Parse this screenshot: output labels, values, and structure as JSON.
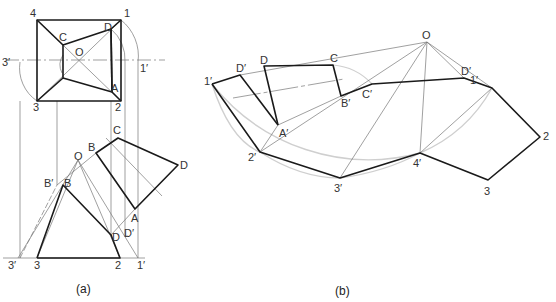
{
  "figure": {
    "type": "technical-drawing"
  },
  "panel_a": {
    "caption": "(a)",
    "top_view_labels": [
      {
        "id": "4",
        "text": "4",
        "x": 30,
        "y": 8
      },
      {
        "id": "1",
        "text": "1",
        "x": 124,
        "y": 8
      },
      {
        "id": "C",
        "text": "C",
        "x": 59,
        "y": 32
      },
      {
        "id": "D",
        "text": "D",
        "x": 104,
        "y": 22
      },
      {
        "id": "O",
        "text": "O",
        "x": 75,
        "y": 47
      },
      {
        "id": "3p",
        "text": "3′",
        "x": 2,
        "y": 57
      },
      {
        "id": "1p",
        "text": "1′",
        "x": 140,
        "y": 63
      },
      {
        "id": "A",
        "text": "A",
        "x": 111,
        "y": 83
      },
      {
        "id": "3",
        "text": "3",
        "x": 33,
        "y": 102
      },
      {
        "id": "2",
        "text": "2",
        "x": 115,
        "y": 102
      }
    ],
    "front_view_labels": [
      {
        "id": "O",
        "text": "O",
        "x": 74,
        "y": 131
      },
      {
        "id": "C",
        "text": "C",
        "x": 113,
        "y": 120
      },
      {
        "id": "B_upper",
        "text": "B",
        "x": 89,
        "y": 142
      },
      {
        "id": "D_right",
        "text": "D",
        "x": 178,
        "y": 160
      },
      {
        "id": "Bp",
        "text": "B′",
        "x": 44,
        "y": 178
      },
      {
        "id": "B",
        "text": "B",
        "x": 64,
        "y": 178
      },
      {
        "id": "A",
        "text": "A",
        "x": 130,
        "y": 214
      },
      {
        "id": "D",
        "text": "D",
        "x": 111,
        "y": 230
      },
      {
        "id": "Dp",
        "text": "D′",
        "x": 123,
        "y": 226
      },
      {
        "id": "3p",
        "text": "3′",
        "x": 8,
        "y": 259
      },
      {
        "id": "3",
        "text": "3",
        "x": 35,
        "y": 259
      },
      {
        "id": "2",
        "text": "2",
        "x": 115,
        "y": 259
      },
      {
        "id": "1p",
        "text": "1′",
        "x": 137,
        "y": 259
      }
    ]
  },
  "panel_b": {
    "caption": "(b)",
    "labels": [
      {
        "id": "O",
        "text": "O",
        "x": 422,
        "y": 30
      },
      {
        "id": "C",
        "text": "C",
        "x": 330,
        "y": 55
      },
      {
        "id": "D",
        "text": "D",
        "x": 260,
        "y": 55
      },
      {
        "id": "Dp_left",
        "text": "D′",
        "x": 236,
        "y": 63
      },
      {
        "id": "1p_left",
        "text": "1′",
        "x": 204,
        "y": 76
      },
      {
        "id": "Bp",
        "text": "B′",
        "x": 341,
        "y": 99
      },
      {
        "id": "Cp",
        "text": "C′",
        "x": 362,
        "y": 89
      },
      {
        "id": "Dp_right",
        "text": "D′",
        "x": 461,
        "y": 65
      },
      {
        "id": "1p_right",
        "text": "1′",
        "x": 492,
        "y": 75
      },
      {
        "id": "Ap",
        "text": "A′",
        "x": 279,
        "y": 128
      },
      {
        "id": "2p",
        "text": "2′",
        "x": 248,
        "y": 152
      },
      {
        "id": "2",
        "text": "2",
        "x": 543,
        "y": 131
      },
      {
        "id": "4p",
        "text": "4′",
        "x": 413,
        "y": 157
      },
      {
        "id": "3p",
        "text": "3′",
        "x": 334,
        "y": 183
      },
      {
        "id": "3",
        "text": "3",
        "x": 484,
        "y": 186
      }
    ]
  },
  "colors": {
    "thick_line": "#1a1a1a",
    "thin_line": "#6a6a6a",
    "arc": "#c8c8c8",
    "text": "#333333"
  }
}
